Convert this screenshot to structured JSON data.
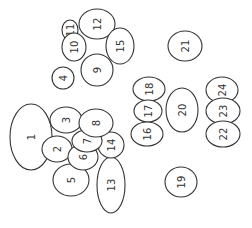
{
  "diagram": {
    "title": "",
    "stroke_color": "#333333",
    "fill_color": "#ffffff",
    "label_rotation_deg": -90,
    "nodes": [
      {
        "id": "1",
        "label": "1",
        "cx": 31,
        "cy": 137,
        "rx": 21,
        "ry": 33
      },
      {
        "id": "4",
        "label": "4",
        "cx": 63,
        "cy": 78,
        "rx": 11,
        "ry": 11
      },
      {
        "id": "11",
        "label": "11",
        "cx": 70,
        "cy": 30,
        "rx": 8,
        "ry": 10
      },
      {
        "id": "10",
        "label": "10",
        "cx": 74,
        "cy": 47,
        "rx": 12,
        "ry": 14
      },
      {
        "id": "12",
        "label": "12",
        "cx": 97,
        "cy": 24,
        "rx": 18,
        "ry": 15
      },
      {
        "id": "15",
        "label": "15",
        "cx": 120,
        "cy": 46,
        "rx": 14,
        "ry": 18
      },
      {
        "id": "9",
        "label": "9",
        "cx": 97,
        "cy": 70,
        "rx": 16,
        "ry": 16
      },
      {
        "id": "3",
        "label": "3",
        "cx": 66,
        "cy": 120,
        "rx": 16,
        "ry": 13
      },
      {
        "id": "2",
        "label": "2",
        "cx": 57,
        "cy": 149,
        "rx": 15,
        "ry": 13
      },
      {
        "id": "5",
        "label": "5",
        "cx": 71,
        "cy": 180,
        "rx": 18,
        "ry": 16
      },
      {
        "id": "13",
        "label": "13",
        "cx": 111,
        "cy": 185,
        "rx": 14,
        "ry": 28
      },
      {
        "id": "14",
        "label": "14",
        "cx": 111,
        "cy": 145,
        "rx": 13,
        "ry": 13
      },
      {
        "id": "6",
        "label": "6",
        "cx": 83,
        "cy": 157,
        "rx": 15,
        "ry": 13
      },
      {
        "id": "7",
        "label": "7",
        "cx": 87,
        "cy": 141,
        "rx": 15,
        "ry": 11
      },
      {
        "id": "8",
        "label": "8",
        "cx": 96,
        "cy": 123,
        "rx": 17,
        "ry": 14
      },
      {
        "id": "21",
        "label": "21",
        "cx": 185,
        "cy": 46,
        "rx": 17,
        "ry": 15
      },
      {
        "id": "18",
        "label": "18",
        "cx": 149,
        "cy": 89,
        "rx": 16,
        "ry": 12
      },
      {
        "id": "17",
        "label": "17",
        "cx": 148,
        "cy": 111,
        "rx": 14,
        "ry": 11
      },
      {
        "id": "16",
        "label": "16",
        "cx": 147,
        "cy": 134,
        "rx": 16,
        "ry": 12
      },
      {
        "id": "20",
        "label": "20",
        "cx": 182,
        "cy": 110,
        "rx": 16,
        "ry": 22
      },
      {
        "id": "24",
        "label": "24",
        "cx": 222,
        "cy": 90,
        "rx": 16,
        "ry": 13
      },
      {
        "id": "23",
        "label": "23",
        "cx": 223,
        "cy": 111,
        "rx": 17,
        "ry": 13
      },
      {
        "id": "22",
        "label": "22",
        "cx": 223,
        "cy": 134,
        "rx": 17,
        "ry": 13
      },
      {
        "id": "19",
        "label": "19",
        "cx": 181,
        "cy": 182,
        "rx": 16,
        "ry": 15
      }
    ]
  }
}
